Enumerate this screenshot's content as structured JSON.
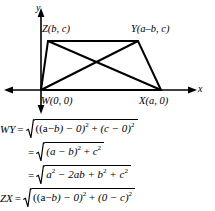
{
  "figure": {
    "axes": {
      "x_label": "x",
      "y_label": "y"
    },
    "vertices": [
      {
        "name": "Z",
        "label": "Z(b, c)",
        "coords": "(b, c)"
      },
      {
        "name": "Y",
        "label": "Y(a–b, c)",
        "coords": "(a–b, c)"
      },
      {
        "name": "W",
        "label": "W(0, 0)",
        "coords": "(0, 0)"
      },
      {
        "name": "X",
        "label": "X(a, 0)",
        "coords": "(a, 0)"
      }
    ],
    "shape": "trapezoid-with-diagonals",
    "stroke_color": "#000000"
  },
  "equations": {
    "line1": {
      "lhs": "WY",
      "eq": "=",
      "radicand_parts": {
        "p1": "((a",
        "p2": "−",
        "p3": "b) − 0)",
        "exp1": "2",
        "plus": "+",
        "p4": "(c − 0)",
        "exp2": "2"
      },
      "text": "WY = √(((a−b)−0)² + (c−0)²)"
    },
    "line2": {
      "lhs": "",
      "eq": "=",
      "radicand_parts": {
        "p1": "(a − b)",
        "exp1": "2",
        "plus": "+",
        "p2": "c",
        "exp2": "2"
      },
      "text": "= √((a−b)² + c²)"
    },
    "line3": {
      "lhs": "",
      "eq": "=",
      "radicand_parts": {
        "p1": "a",
        "exp1": "2",
        "minus": "− 2ab",
        "plus1": "+ b",
        "exp2": "2",
        "plus2": "+ c",
        "exp3": "2"
      },
      "text": "= √(a² − 2ab + b² + c²)"
    },
    "line4": {
      "lhs": "ZX",
      "eq": "=",
      "radicand_parts": {
        "p1": "((a",
        "p2": "−",
        "p3": "b) − 0)",
        "exp1": "2",
        "plus": "+",
        "p4": "(0 − c)",
        "exp2": "2"
      },
      "text": "ZX = √(((a−b)−0)² + (0−c)²)"
    }
  }
}
